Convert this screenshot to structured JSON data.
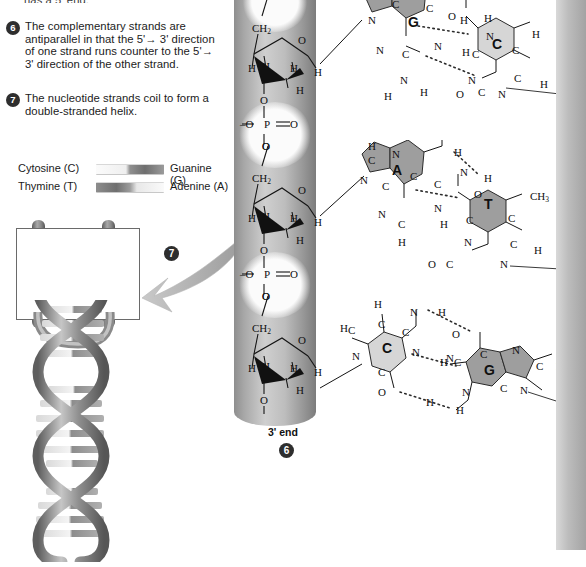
{
  "figure": {
    "truncated_top_line": "has a 5' end."
  },
  "steps": [
    {
      "number": "6",
      "text": "The complementary strands are antiparallel in that the 5'→ 3' direction of one strand runs counter to the 5'→ 3' direction of the other strand."
    },
    {
      "number": "7",
      "text": "The nucleotide strands coil to form a double-stranded helix."
    }
  ],
  "legend": {
    "rows": [
      {
        "left": "Cytosine (C)",
        "right": "Guanine (G)",
        "bar": "cg"
      },
      {
        "left": "Thymine (T)",
        "right": "Adenine (A)",
        "bar": "ta"
      }
    ]
  },
  "ladder": {
    "callout_badge": "7",
    "rungs": [
      {
        "left": "T",
        "right": "A",
        "left_shade": "light",
        "right_shade": "dark"
      },
      {
        "left": "G",
        "right": "C",
        "left_shade": "dark",
        "right_shade": "light"
      },
      {
        "left": "A",
        "right": "T",
        "left_shade": "light",
        "right_shade": "dark"
      },
      {
        "left": "C",
        "right": "G",
        "left_shade": "light",
        "right_shade": "dark"
      }
    ]
  },
  "backbone": {
    "end_label": "3' end",
    "end_badge": "6",
    "repeat_units": [
      {
        "ch2": "CH",
        "ch2_sub": "2",
        "ring_o": "O",
        "phosphate": {
          "p": "P",
          "o_left": "O",
          "o_right": "O",
          "o_top": "O",
          "o_bottom": "O",
          "charge": "–"
        },
        "h_labels": [
          "H",
          "H",
          "H",
          "H",
          "H"
        ]
      }
    ],
    "atoms": {
      "O": "O",
      "H": "H",
      "P": "P",
      "C": "C",
      "N": "N"
    }
  },
  "base_pairs": [
    {
      "id": "gc-top",
      "left_base": {
        "letter": "G",
        "name": "Guanine",
        "shade": "dark"
      },
      "right_base": {
        "letter": "C",
        "name": "Cytosine",
        "shade": "light"
      },
      "hydrogen_bonds": 3,
      "atoms_left": [
        "N",
        "C",
        "C",
        "N",
        "C",
        "N",
        "O",
        "N",
        "H",
        "H"
      ],
      "atoms_right": [
        "N",
        "C",
        "C",
        "C",
        "N",
        "C",
        "O",
        "H",
        "H",
        "H"
      ]
    },
    {
      "id": "at-middle",
      "left_base": {
        "letter": "A",
        "name": "Adenine",
        "shade": "dark"
      },
      "right_base": {
        "letter": "T",
        "name": "Thymine",
        "shade": "dark"
      },
      "hydrogen_bonds": 2,
      "methyl": "CH",
      "methyl_sub": "3",
      "atoms_left": [
        "H",
        "C",
        "N",
        "N",
        "C",
        "C",
        "C",
        "N",
        "N",
        "H",
        "H"
      ],
      "atoms_right": [
        "O",
        "C",
        "C",
        "N",
        "C",
        "N",
        "O",
        "H",
        "H"
      ]
    },
    {
      "id": "cg-bottom",
      "left_base": {
        "letter": "C",
        "name": "Cytosine",
        "shade": "light"
      },
      "right_base": {
        "letter": "G",
        "name": "Guanine",
        "shade": "dark"
      },
      "hydrogen_bonds": 3,
      "atoms_left": [
        "H",
        "C",
        "C",
        "C",
        "N",
        "N",
        "C",
        "O",
        "N",
        "H",
        "H"
      ],
      "atoms_right": [
        "O",
        "C",
        "C",
        "N",
        "C",
        "H",
        "C",
        "N",
        "N",
        "N",
        "H"
      ]
    }
  ],
  "colors": {
    "base_dark": "#9e9e9e",
    "base_light": "#d6d6d6",
    "cylinder": "#b8b8b8",
    "badge": "#2e2e2e",
    "text": "#1b1b1b",
    "bond": "#1a1a1a"
  }
}
